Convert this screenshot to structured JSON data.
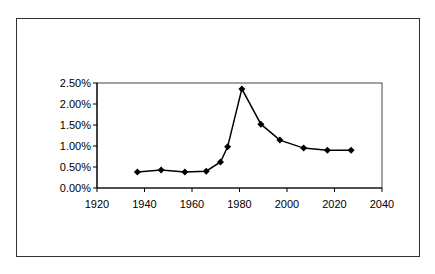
{
  "chart_data": {
    "type": "line",
    "title": "",
    "xlabel": "",
    "ylabel": "",
    "x": [
      1937,
      1947,
      1957,
      1966,
      1972,
      1975,
      1981,
      1989,
      1997,
      2007,
      2017,
      2027
    ],
    "series": [
      {
        "name": "Series 1",
        "values": [
          0.0038,
          0.0043,
          0.0038,
          0.004,
          0.0062,
          0.0098,
          0.0236,
          0.0152,
          0.0114,
          0.0095,
          0.009,
          0.009
        ],
        "marker": "diamond",
        "color": "#000000"
      }
    ],
    "xlim": [
      1920,
      2040
    ],
    "ylim": [
      0,
      0.025
    ],
    "x_ticks": [
      "1920",
      "1940",
      "1960",
      "1980",
      "2000",
      "2020",
      "2040"
    ],
    "y_ticks": [
      "0.00%",
      "0.50%",
      "1.00%",
      "1.50%",
      "2.00%",
      "2.50%"
    ],
    "grid": false,
    "legend": "none"
  }
}
